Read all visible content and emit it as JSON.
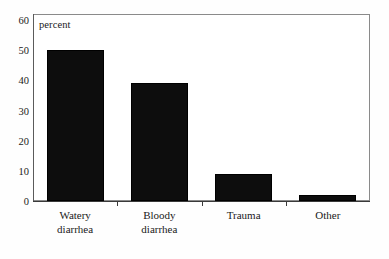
{
  "chart_data": {
    "type": "bar",
    "title": "",
    "subtitle": "",
    "xlabel": "",
    "ylabel": "percent",
    "unit_caption": "percent",
    "categories": [
      "Watery diarrhea",
      "Bloody diarrhea",
      "Trauma",
      "Other"
    ],
    "category_lines": [
      [
        "Watery",
        "diarrhea"
      ],
      [
        "Bloody",
        "diarrhea"
      ],
      [
        "Trauma",
        ""
      ],
      [
        "Other",
        ""
      ]
    ],
    "values": [
      50,
      39,
      9,
      2
    ],
    "ylim": [
      0,
      62
    ],
    "yticks": [
      0,
      10,
      20,
      30,
      40,
      50,
      60
    ],
    "ytick_labels": [
      "0",
      "10",
      "20",
      "30",
      "40",
      "50",
      "60"
    ],
    "grid": false,
    "legend": "none",
    "bar_color": "#0d0d0d",
    "frame_color": "#8a8a8a",
    "background": "#ffffff"
  }
}
